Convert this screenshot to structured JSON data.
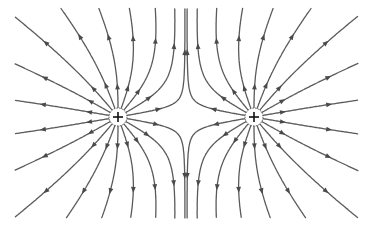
{
  "diagram": {
    "colors": {
      "line": "#5a5a5a",
      "arrow": "#4a4a4a",
      "background": "#ffffff",
      "sign": "#111111"
    },
    "charges": [
      {
        "id": "charge-left",
        "x": 118,
        "y": 117,
        "q": 1,
        "sign": "+"
      },
      {
        "id": "charge-right",
        "x": 254,
        "y": 117,
        "q": 1,
        "sign": "+"
      }
    ],
    "lines_per_charge": 18,
    "arrows_per_line": 2,
    "charge_radius": 9,
    "bounds": {
      "xmin": 15,
      "xmax": 358,
      "ymin": 8,
      "ymax": 218
    }
  }
}
